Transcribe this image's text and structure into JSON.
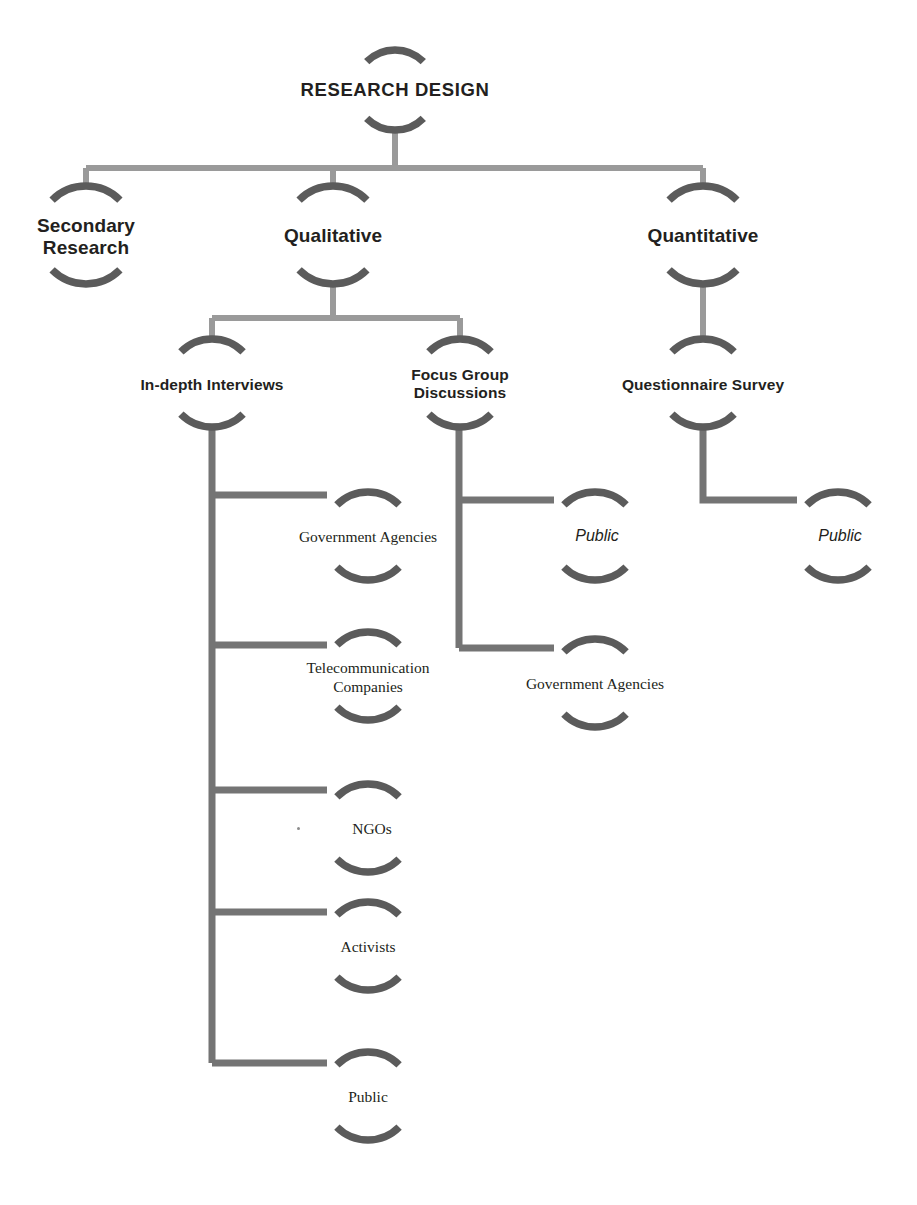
{
  "diagram": {
    "title": "RESEARCH DESIGN",
    "type": "hierarchical tree / organogram",
    "colors": {
      "arc_dark": "#5b5b5b",
      "connector_light": "#9a9a9a",
      "connector_mid": "#6e6e6e",
      "text": "#231f20",
      "background": "#ffffff"
    },
    "nodes": {
      "root": {
        "label": "RESEARCH DESIGN",
        "level": 0,
        "cx": 395,
        "cy": 90,
        "r": 40,
        "style": "bold-sans-caps"
      },
      "secondary_research": {
        "label": "Secondary\nResearch",
        "level": 1,
        "cx": 86,
        "cy": 235,
        "r": 48,
        "style": "bold-sans"
      },
      "qualitative": {
        "label": "Qualitative",
        "level": 1,
        "cx": 333,
        "cy": 235,
        "r": 48,
        "style": "bold-sans"
      },
      "quantitative": {
        "label": "Quantitative",
        "level": 1,
        "cx": 703,
        "cy": 235,
        "r": 48,
        "style": "bold-sans"
      },
      "in_depth_interviews": {
        "label": "In-depth Interviews",
        "level": 2,
        "cx": 212,
        "cy": 383,
        "r": 44,
        "style": "bold-sans"
      },
      "focus_group_discussions": {
        "label": "Focus Group\nDiscussions",
        "level": 2,
        "cx": 460,
        "cy": 383,
        "r": 44,
        "style": "bold-sans"
      },
      "questionnaire_survey": {
        "label": "Questionnaire Survey",
        "level": 2,
        "cx": 703,
        "cy": 383,
        "r": 44,
        "style": "bold-sans"
      },
      "idi_government_agencies": {
        "label": "Government Agencies",
        "level": 3,
        "cx": 368,
        "cy": 536,
        "r": 44,
        "style": "serif"
      },
      "idi_telecom_companies": {
        "label": "Telecommunication\nCompanies",
        "level": 3,
        "cx": 368,
        "cy": 676,
        "r": 44,
        "style": "serif"
      },
      "idi_ngos": {
        "label": "NGOs",
        "level": 3,
        "cx": 368,
        "cy": 828,
        "r": 44,
        "style": "serif"
      },
      "idi_activists": {
        "label": "Activists",
        "level": 3,
        "cx": 368,
        "cy": 946,
        "r": 44,
        "style": "serif"
      },
      "idi_public": {
        "label": "Public",
        "level": 3,
        "cx": 368,
        "cy": 1096,
        "r": 44,
        "style": "serif"
      },
      "fgd_public": {
        "label": "Public",
        "level": 3,
        "cx": 595,
        "cy": 536,
        "r": 44,
        "style": "italic-sans"
      },
      "fgd_government_agencies": {
        "label": "Government Agencies",
        "level": 3,
        "cx": 595,
        "cy": 683,
        "r": 44,
        "style": "serif"
      },
      "qs_public": {
        "label": "Public",
        "level": 3,
        "cx": 838,
        "cy": 536,
        "r": 44,
        "style": "italic-sans"
      }
    },
    "edges": [
      {
        "from": "root",
        "to": "secondary_research"
      },
      {
        "from": "root",
        "to": "qualitative"
      },
      {
        "from": "root",
        "to": "quantitative"
      },
      {
        "from": "qualitative",
        "to": "in_depth_interviews"
      },
      {
        "from": "qualitative",
        "to": "focus_group_discussions"
      },
      {
        "from": "quantitative",
        "to": "questionnaire_survey"
      },
      {
        "from": "in_depth_interviews",
        "to": "idi_government_agencies"
      },
      {
        "from": "in_depth_interviews",
        "to": "idi_telecom_companies"
      },
      {
        "from": "in_depth_interviews",
        "to": "idi_ngos"
      },
      {
        "from": "in_depth_interviews",
        "to": "idi_activists"
      },
      {
        "from": "in_depth_interviews",
        "to": "idi_public"
      },
      {
        "from": "focus_group_discussions",
        "to": "fgd_public"
      },
      {
        "from": "focus_group_discussions",
        "to": "fgd_government_agencies"
      },
      {
        "from": "questionnaire_survey",
        "to": "qs_public"
      }
    ]
  }
}
